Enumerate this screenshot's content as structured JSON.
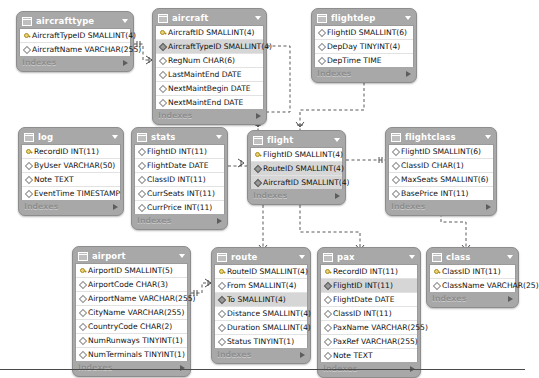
{
  "diagram": {
    "background": "#ffffff",
    "header_color": "#a8a8a8",
    "fk_row_color": "#d6d6d6",
    "indexes_label": "Indexes",
    "relationship_style": "dashed-crowsfoot"
  },
  "tables": [
    {
      "name": "aircrafttype",
      "x": 16,
      "y": 11,
      "w": 118,
      "columns": [
        {
          "icon": "primary-key-icon",
          "text": "AircraftTypeID SMALLINT(4)",
          "kind": "pk"
        },
        {
          "icon": "diamond-icon",
          "text": "AircraftName VARCHAR(255)",
          "kind": "plain"
        }
      ]
    },
    {
      "name": "aircraft",
      "x": 152,
      "y": 8,
      "w": 115,
      "columns": [
        {
          "icon": "primary-key-icon",
          "text": "AircraftID SMALLINT(4)",
          "kind": "pk"
        },
        {
          "icon": "foreign-key-icon",
          "text": "AircraftTypeID SMALLINT(4)",
          "kind": "fk"
        },
        {
          "icon": "diamond-icon",
          "text": "RegNum CHAR(6)",
          "kind": "plain"
        },
        {
          "icon": "diamond-icon",
          "text": "LastMaintEnd DATE",
          "kind": "plain"
        },
        {
          "icon": "diamond-icon",
          "text": "NextMaintBegin DATE",
          "kind": "plain"
        },
        {
          "icon": "diamond-icon",
          "text": "NextMaintEnd DATE",
          "kind": "plain"
        }
      ]
    },
    {
      "name": "flightdep",
      "x": 311,
      "y": 8,
      "w": 106,
      "columns": [
        {
          "icon": "foreign-key-icon",
          "text": "FlightID SMALLINT(6)",
          "kind": "plain"
        },
        {
          "icon": "diamond-icon",
          "text": "DepDay TINYINT(4)",
          "kind": "plain"
        },
        {
          "icon": "diamond-icon",
          "text": "DepTime TIME",
          "kind": "plain"
        }
      ]
    },
    {
      "name": "log",
      "x": 18,
      "y": 127,
      "w": 106,
      "columns": [
        {
          "icon": "primary-key-icon",
          "text": "RecordID INT(11)",
          "kind": "pk"
        },
        {
          "icon": "diamond-icon",
          "text": "ByUser VARCHAR(50)",
          "kind": "plain"
        },
        {
          "icon": "diamond-icon",
          "text": "Note TEXT",
          "kind": "plain"
        },
        {
          "icon": "diamond-icon",
          "text": "EventTime TIMESTAMP",
          "kind": "plain"
        }
      ]
    },
    {
      "name": "stats",
      "x": 131,
      "y": 127,
      "w": 97,
      "columns": [
        {
          "icon": "diamond-icon",
          "text": "FlightID INT(11)",
          "kind": "plain"
        },
        {
          "icon": "diamond-icon",
          "text": "FlightDate DATE",
          "kind": "plain"
        },
        {
          "icon": "diamond-icon",
          "text": "ClassID INT(11)",
          "kind": "plain"
        },
        {
          "icon": "diamond-icon",
          "text": "CurrSeats INT(11)",
          "kind": "plain"
        },
        {
          "icon": "diamond-icon",
          "text": "CurrPrice INT(11)",
          "kind": "plain"
        }
      ]
    },
    {
      "name": "flight",
      "x": 247,
      "y": 130,
      "w": 99,
      "columns": [
        {
          "icon": "primary-key-icon",
          "text": "FlightID SMALLINT(4)",
          "kind": "pk"
        },
        {
          "icon": "foreign-key-icon",
          "text": "RouteID SMALLINT(4)",
          "kind": "fk"
        },
        {
          "icon": "foreign-key-icon",
          "text": "AircraftID SMALLINT(4)",
          "kind": "fk"
        }
      ]
    },
    {
      "name": "flightclass",
      "x": 385,
      "y": 127,
      "w": 112,
      "columns": [
        {
          "icon": "diamond-icon",
          "text": "FlightID SMALLINT(6)",
          "kind": "plain"
        },
        {
          "icon": "diamond-icon",
          "text": "ClassID CHAR(1)",
          "kind": "plain"
        },
        {
          "icon": "diamond-icon",
          "text": "MaxSeats SMALLINT(6)",
          "kind": "plain"
        },
        {
          "icon": "diamond-icon",
          "text": "BasePrice INT(11)",
          "kind": "plain"
        }
      ]
    },
    {
      "name": "airport",
      "x": 72,
      "y": 246,
      "w": 119,
      "columns": [
        {
          "icon": "primary-key-icon",
          "text": "AirportID SMALLINT(5)",
          "kind": "pk"
        },
        {
          "icon": "diamond-icon",
          "text": "AirportCode CHAR(3)",
          "kind": "plain"
        },
        {
          "icon": "diamond-icon",
          "text": "AirportName VARCHAR(255)",
          "kind": "plain"
        },
        {
          "icon": "diamond-icon",
          "text": "CityName VARCHAR(255)",
          "kind": "plain"
        },
        {
          "icon": "diamond-icon",
          "text": "CountryCode CHAR(2)",
          "kind": "plain"
        },
        {
          "icon": "diamond-icon",
          "text": "NumRunways TINYINT(1)",
          "kind": "plain"
        },
        {
          "icon": "diamond-icon",
          "text": "NumTerminals TINYINT(1)",
          "kind": "plain"
        }
      ]
    },
    {
      "name": "route",
      "x": 211,
      "y": 247,
      "w": 100,
      "columns": [
        {
          "icon": "primary-key-icon",
          "text": "RouteID SMALLINT(4)",
          "kind": "pk"
        },
        {
          "icon": "diamond-icon",
          "text": "From SMALLINT(4)",
          "kind": "plain"
        },
        {
          "icon": "foreign-key-icon",
          "text": "To SMALLINT(4)",
          "kind": "fk"
        },
        {
          "icon": "diamond-icon",
          "text": "Distance SMALLINT(4)",
          "kind": "plain"
        },
        {
          "icon": "diamond-icon",
          "text": "Duration SMALLINT(4)",
          "kind": "plain"
        },
        {
          "icon": "diamond-icon",
          "text": "Status TINYINT(1)",
          "kind": "plain"
        }
      ]
    },
    {
      "name": "pax",
      "x": 317,
      "y": 247,
      "w": 104,
      "columns": [
        {
          "icon": "primary-key-icon",
          "text": "RecordID INT(11)",
          "kind": "pk"
        },
        {
          "icon": "foreign-key-icon",
          "text": "FlightID INT(11)",
          "kind": "fk"
        },
        {
          "icon": "diamond-icon",
          "text": "FlightDate DATE",
          "kind": "plain"
        },
        {
          "icon": "diamond-icon",
          "text": "ClassID INT(11)",
          "kind": "plain"
        },
        {
          "icon": "diamond-icon",
          "text": "PaxName VARCHAR(255)",
          "kind": "plain"
        },
        {
          "icon": "diamond-icon",
          "text": "PaxRef VARCHAR(255)",
          "kind": "plain"
        },
        {
          "icon": "diamond-icon",
          "text": "Note TEXT",
          "kind": "plain"
        }
      ]
    },
    {
      "name": "class",
      "x": 426,
      "y": 247,
      "w": 93,
      "columns": [
        {
          "icon": "primary-key-icon",
          "text": "ClassID INT(11)",
          "kind": "pk"
        },
        {
          "icon": "diamond-icon",
          "text": "ClassName VARCHAR(25)",
          "kind": "plain"
        }
      ]
    }
  ]
}
